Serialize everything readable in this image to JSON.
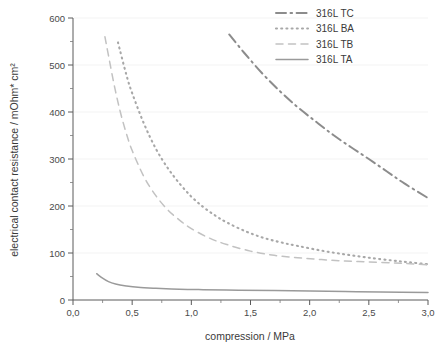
{
  "chart_data": {
    "type": "line",
    "title": "",
    "xlabel": "compression / MPa",
    "ylabel": "electrical contact resistance / mOhm* cm²",
    "xlim": [
      0,
      3.0
    ],
    "ylim": [
      0,
      600
    ],
    "xticks": [
      "0,0",
      "0,5",
      "1,0",
      "1,5",
      "2,0",
      "2,5",
      "3,0"
    ],
    "xtick_values": [
      0,
      0.5,
      1.0,
      1.5,
      2.0,
      2.5,
      3.0
    ],
    "yticks": [
      "0",
      "100",
      "200",
      "300",
      "400",
      "500",
      "600"
    ],
    "ytick_values": [
      0,
      100,
      200,
      300,
      400,
      500,
      600
    ],
    "yminor_values": [
      50,
      150,
      250,
      350,
      450,
      550
    ],
    "grid": "horizontal-faint",
    "legend_position": "top-right",
    "series": [
      {
        "name": "316L TC",
        "style": "dash-dot",
        "color": "#8c8c8c",
        "x": [
          1.32,
          1.45,
          1.6,
          1.75,
          1.9,
          2.05,
          2.2,
          2.35,
          2.5,
          2.65,
          2.8,
          3.0
        ],
        "values": [
          565,
          525,
          482,
          444,
          410,
          380,
          351,
          325,
          300,
          274,
          248,
          217
        ]
      },
      {
        "name": "316L BA",
        "style": "dotted",
        "color": "#a8a8a8",
        "x": [
          0.38,
          0.45,
          0.5,
          0.6,
          0.7,
          0.8,
          0.9,
          1.0,
          1.1,
          1.2,
          1.3,
          1.45,
          1.6,
          1.75,
          1.9,
          2.1,
          2.3,
          2.5,
          2.7,
          2.85,
          3.0
        ],
        "values": [
          548,
          480,
          440,
          375,
          322,
          281,
          248,
          220,
          198,
          180,
          165,
          147,
          133,
          123,
          115,
          105,
          97,
          90,
          84,
          80,
          76
        ]
      },
      {
        "name": "316L TB",
        "style": "dashed",
        "color": "#c2c2c2",
        "x": [
          0.27,
          0.3,
          0.35,
          0.4,
          0.45,
          0.5,
          0.6,
          0.7,
          0.8,
          0.9,
          1.0,
          1.15,
          1.3,
          1.5,
          1.7,
          1.9,
          2.1,
          2.3,
          2.5,
          2.7,
          2.85,
          3.0
        ],
        "values": [
          560,
          520,
          455,
          400,
          355,
          318,
          262,
          222,
          192,
          170,
          152,
          132,
          118,
          104,
          95,
          90,
          86,
          83,
          81,
          79,
          77,
          75
        ]
      },
      {
        "name": "316L TA",
        "style": "solid",
        "color": "#9a9a9a",
        "x": [
          0.2,
          0.24,
          0.3,
          0.36,
          0.45,
          0.55,
          0.7,
          0.9,
          1.1,
          1.4,
          1.7,
          2.0,
          2.3,
          2.6,
          3.0
        ],
        "values": [
          56,
          48,
          39,
          34,
          30,
          27,
          25,
          23,
          22,
          21,
          20,
          19,
          18,
          17,
          16
        ]
      }
    ]
  },
  "legend": {
    "entries": [
      {
        "label": "316L TC"
      },
      {
        "label": "316L BA"
      },
      {
        "label": "316L TB"
      },
      {
        "label": "316L TA"
      }
    ]
  }
}
